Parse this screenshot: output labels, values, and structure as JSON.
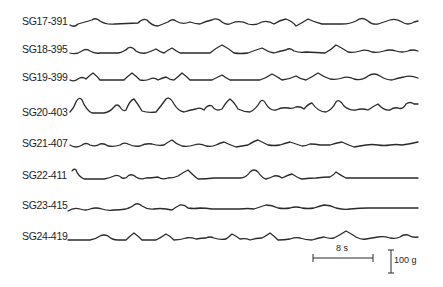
{
  "figure": {
    "traces": [
      {
        "label": "SG17-391",
        "baseline_y": 24
      },
      {
        "label": "SG18-395",
        "baseline_y": 52
      },
      {
        "label": "SG19-399",
        "baseline_y": 79
      },
      {
        "label": "SG20-403",
        "baseline_y": 113
      },
      {
        "label": "SG21-407",
        "baseline_y": 145
      },
      {
        "label": "SG22-411",
        "baseline_y": 178
      },
      {
        "label": "SG23-415",
        "baseline_y": 209
      },
      {
        "label": "SG24-419",
        "baseline_y": 240
      }
    ],
    "scale_bar": {
      "time_label": "8 s",
      "force_label": "100 g"
    }
  }
}
